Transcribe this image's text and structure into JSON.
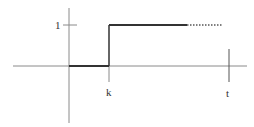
{
  "diagram": {
    "type": "unit step function plot",
    "labels": {
      "y_tick": "1",
      "x_step": "k",
      "x_end": "t"
    },
    "colors": {
      "axis": "#8a8a8a",
      "function": "#333333",
      "background": "#ffffff"
    },
    "function": {
      "description": "0 for x < k, 1 for x >= k",
      "solid_segment_end_x": 187,
      "dotted_segment_end_x": 222
    }
  }
}
